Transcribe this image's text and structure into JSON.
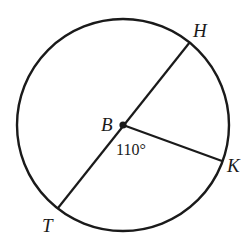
{
  "diagram": {
    "type": "circle-geometry",
    "center": {
      "label": "B",
      "x": 123,
      "y": 125
    },
    "circle": {
      "cx": 123,
      "cy": 125,
      "r": 106,
      "stroke": "#1a1a1a"
    },
    "points": [
      {
        "label": "H",
        "x": 190,
        "y": 42,
        "label_x": 193,
        "label_y": 37
      },
      {
        "label": "K",
        "x": 222,
        "y": 161,
        "label_x": 227,
        "label_y": 172
      },
      {
        "label": "T",
        "x": 58,
        "y": 208,
        "label_x": 42,
        "label_y": 232
      }
    ],
    "segments": [
      {
        "from": "T",
        "to": "H",
        "note": "diameter"
      },
      {
        "from": "B",
        "to": "K",
        "note": "radius"
      }
    ],
    "angle": {
      "vertex": "B",
      "between": [
        "T",
        "K"
      ],
      "text": "110°",
      "label_x": 116,
      "label_y": 155
    }
  }
}
